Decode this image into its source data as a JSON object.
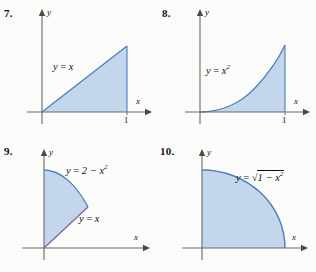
{
  "page": {
    "background_color": "#fbfbfa",
    "width": 316,
    "height": 272
  },
  "style": {
    "region_fill": "#c3d6ec",
    "curve_stroke": "#4a7fbd",
    "line_stroke_purple": "#8a5f9e",
    "axis_color": "#6b6b6b",
    "text_color": "#111111"
  },
  "problems": [
    {
      "number": "7.",
      "equation_label": "y = x",
      "equation_parts": {
        "lhs": "y",
        "op": "=",
        "rhs": "x",
        "exp": ""
      },
      "x_axis_label": "x",
      "y_axis_label": "y",
      "x_tick": "1",
      "region": "triangle under y = x from x = 0 to x = 1"
    },
    {
      "number": "8.",
      "equation_label": "y = x²",
      "equation_parts": {
        "lhs": "y",
        "op": "=",
        "rhs": "x",
        "exp": "2"
      },
      "x_axis_label": "x",
      "y_axis_label": "y",
      "x_tick": "1",
      "region": "area under y = x squared from x = 0 to x = 1"
    },
    {
      "number": "9.",
      "equation_label": "y = 2 − x²",
      "equation_parts": {
        "lhs": "y",
        "op": "=",
        "rhs": "2 − x",
        "exp": "2"
      },
      "second_equation_label": "y = x",
      "second_equation_parts": {
        "lhs": "y",
        "op": "=",
        "rhs": "x",
        "exp": ""
      },
      "x_axis_label": "x",
      "y_axis_label": "y",
      "x_tick": "",
      "region": "region bounded above by y = 2 - x squared and below by y = x"
    },
    {
      "number": "10.",
      "equation_label": "y = √(1 − x²)",
      "equation_parts": {
        "lhs": "y",
        "op": "=",
        "radical_body": "1 − x",
        "exp": "2"
      },
      "x_axis_label": "x",
      "y_axis_label": "y",
      "x_tick": "",
      "region": "quarter disk of radius 1 in the first quadrant"
    }
  ]
}
